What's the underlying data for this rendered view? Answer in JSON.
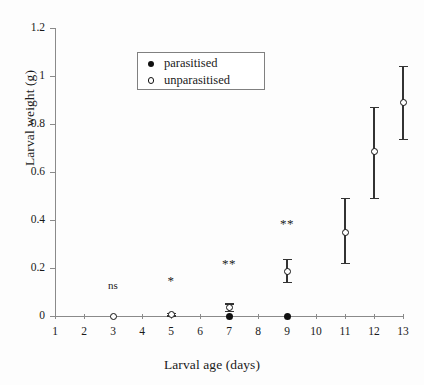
{
  "chart_data": {
    "type": "scatter",
    "title": "",
    "xlabel": "Larval age (days)",
    "ylabel": "Larval weight (g)",
    "xlim": [
      1,
      13
    ],
    "ylim": [
      0,
      1.2
    ],
    "xticks": [
      1,
      2,
      3,
      4,
      5,
      6,
      7,
      8,
      9,
      10,
      11,
      12,
      13
    ],
    "xtick_labels": [
      "1",
      "2",
      "3",
      "4",
      "5",
      "6",
      "7",
      "8",
      "9",
      "10",
      "11",
      "12",
      "13"
    ],
    "yticks": [
      0,
      0.2,
      0.4,
      0.6,
      0.8,
      1.0,
      1.2
    ],
    "ytick_labels": [
      "0",
      "0.2",
      "0.4",
      "0.6",
      "0.8",
      "1",
      "1.2"
    ],
    "grid": false,
    "legend_position": "upper-center",
    "series": [
      {
        "name": "parasitised",
        "marker": "filled-circle",
        "x": [
          7,
          9
        ],
        "values": [
          0.0,
          0.0
        ],
        "yerr_low": [
          0.0,
          0.0
        ],
        "yerr_high": [
          0.0,
          0.0
        ]
      },
      {
        "name": "unparasitised",
        "marker": "open-circle",
        "x": [
          3,
          5,
          7,
          9,
          11,
          12,
          13
        ],
        "values": [
          0.0,
          0.005,
          0.035,
          0.185,
          0.35,
          0.685,
          0.89
        ],
        "yerr_low": [
          0.0,
          0.0,
          0.02,
          0.14,
          0.22,
          0.49,
          0.735
        ],
        "yerr_high": [
          0.0,
          0.01,
          0.05,
          0.235,
          0.49,
          0.87,
          1.04
        ]
      }
    ],
    "annotations": [
      {
        "x": 3,
        "y": 0.125,
        "text": "ns"
      },
      {
        "x": 5,
        "y": 0.145,
        "text": "*"
      },
      {
        "x": 7,
        "y": 0.215,
        "text": "**"
      },
      {
        "x": 9,
        "y": 0.385,
        "text": "**"
      }
    ]
  },
  "legend": {
    "entries": [
      {
        "label": "parasitised",
        "marker": "filled-circle"
      },
      {
        "label": "unparasitised",
        "marker": "open-circle"
      }
    ]
  },
  "colors": {
    "marker": "#111111",
    "axis": "#8a8a8a",
    "error": "#333333",
    "background": "#fdfdfd",
    "legend_border": "#808080"
  }
}
